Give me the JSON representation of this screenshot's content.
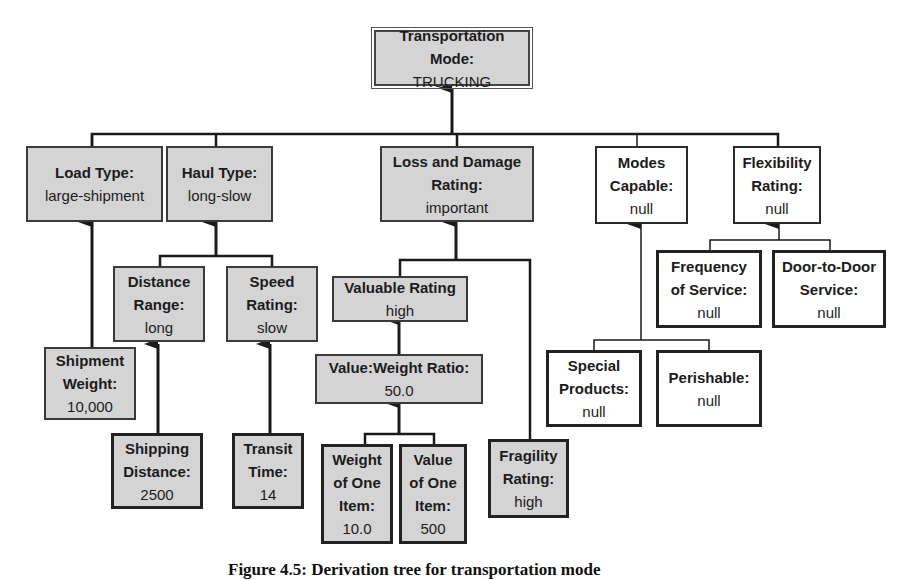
{
  "diagram": {
    "nodes": {
      "root": {
        "label": "Transportation Mode:",
        "value": "TRUCKING"
      },
      "load_type": {
        "label": "Load Type:",
        "value": "large-shipment"
      },
      "haul_type": {
        "label": "Haul Type:",
        "value": "long-slow"
      },
      "loss_damage": {
        "label1": "Loss and Damage",
        "label2": "Rating:",
        "value": "important"
      },
      "modes_capable": {
        "label1": "Modes",
        "label2": "Capable:",
        "value": "null"
      },
      "flexibility": {
        "label1": "Flexibility",
        "label2": "Rating:",
        "value": "null"
      },
      "distance_range": {
        "label1": "Distance",
        "label2": "Range:",
        "value": "long"
      },
      "speed_rating": {
        "label1": "Speed",
        "label2": "Rating:",
        "value": "slow"
      },
      "shipment_weight": {
        "label1": "Shipment",
        "label2": "Weight:",
        "value": "10,000"
      },
      "shipping_distance": {
        "label1": "Shipping",
        "label2": "Distance:",
        "value": "2500"
      },
      "transit_time": {
        "label1": "Transit",
        "label2": "Time:",
        "value": "14"
      },
      "valuable_rating": {
        "label": "Valuable Rating",
        "value": "high"
      },
      "value_weight_ratio": {
        "label": "Value:Weight Ratio:",
        "value": "50.0"
      },
      "weight_one_item": {
        "label1": "Weight",
        "label2": "of One",
        "label3": "Item:",
        "value": "10.0"
      },
      "value_one_item": {
        "label1": "Value",
        "label2": "of One",
        "label3": "Item:",
        "value": "500"
      },
      "fragility": {
        "label1": "Fragility",
        "label2": "Rating:",
        "value": "high"
      },
      "frequency": {
        "label1": "Frequency",
        "label2": "of Service:",
        "value": "null"
      },
      "door_to_door": {
        "label1": "Door-to-Door",
        "label2": "Service:",
        "value": "null"
      },
      "special_products": {
        "label1": "Special",
        "label2": "Products:",
        "value": "null"
      },
      "perishable": {
        "label": "Perishable:",
        "value": "null"
      }
    },
    "caption": "Figure 4.5: Derivation tree for transportation mode"
  }
}
